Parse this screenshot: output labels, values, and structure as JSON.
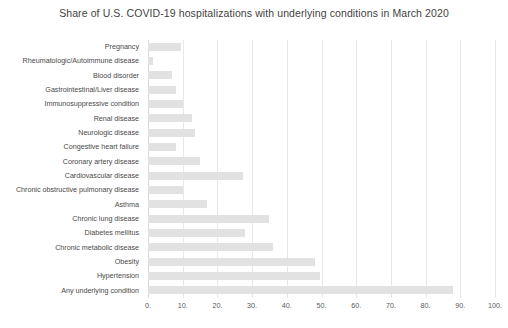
{
  "chart_data": {
    "type": "bar",
    "orientation": "horizontal",
    "title": "Share of U.S. COVID-19 hospitalizations with underlying conditions in March 2020",
    "xlabel": "",
    "ylabel": "",
    "xlim": [
      0,
      100
    ],
    "xticks": [
      0,
      10,
      20,
      30,
      40,
      50,
      60,
      70,
      80,
      90,
      100
    ],
    "xtick_labels": [
      "0.",
      "10.",
      "20.",
      "30.",
      "40.",
      "50.",
      "60.",
      "70.",
      "80.",
      "90.",
      "100."
    ],
    "grid": true,
    "legend": "none",
    "bar_color": "#e2e2e2",
    "categories": [
      "Pregnancy",
      "Rheumatologic/Autoimmune disease",
      "Blood disorder",
      "Gastrointestinal/Liver disease",
      "Immunosuppressive condition",
      "Renal disease",
      "Neurologic disease",
      "Congestive heart failure",
      "Coronary artery disease",
      "Cardiovascular disease",
      "Chronic obstructive pulmonary disease",
      "Asthma",
      "Chronic lung disease",
      "Diabetes mellitus",
      "Chronic metabolic disease",
      "Obesity",
      "Hypertension",
      "Any underlying condition"
    ],
    "values": [
      9.5,
      1.5,
      7,
      8,
      10,
      12.6,
      13.5,
      8,
      15,
      27.5,
      10,
      17,
      35,
      28,
      36,
      48,
      49.7,
      88
    ]
  }
}
